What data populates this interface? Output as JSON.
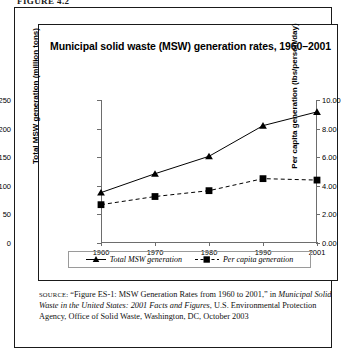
{
  "folio": {
    "text": "FIGURE 4.2"
  },
  "figure": {
    "title": "Municipal solid waste (MSW) generation rates, 1960–2001"
  },
  "legend": {
    "items": [
      {
        "label": "Total MSW generation",
        "marker": "triangle-marker",
        "line": "solid"
      },
      {
        "label": "Per capita generation",
        "marker": "square-marker",
        "line": "dashed"
      }
    ]
  },
  "source": {
    "label": "SOURCE:",
    "part1": " “Figure ES-1: MSW Generation Rates from 1960 to 2001,” in ",
    "italic": "Municipal Solid Waste in the United States: 2001 Facts and Figures",
    "part2": ", U.S. Environmental Protection Agency, Office of Solid Waste, Washington, DC, October 2003"
  },
  "chart_data": {
    "type": "line",
    "title": "Municipal solid waste (MSW) generation rates, 1960–2001",
    "xlabel": "",
    "categories": [
      "1960",
      "1970",
      "1980",
      "1990",
      "2001"
    ],
    "x_ticks": [
      "1960",
      "1970",
      "1980",
      "1990",
      "2001"
    ],
    "grid": false,
    "legend_position": "bottom",
    "axes": [
      {
        "side": "left",
        "label": "Total MSW generation (million tons)",
        "ylim": [
          0,
          250
        ],
        "ticks": [
          0,
          50,
          100,
          150,
          200,
          250
        ],
        "tick_labels": [
          "0",
          "50",
          "100",
          "150",
          "200",
          "250"
        ]
      },
      {
        "side": "right",
        "label": "Per capita generation (lbs/person/day)",
        "ylim": [
          0,
          10
        ],
        "ticks": [
          0,
          2,
          4,
          6,
          8,
          10
        ],
        "tick_labels": [
          "0.00",
          "2.00",
          "4.00",
          "6.00",
          "8.00",
          "10.00"
        ]
      }
    ],
    "series": [
      {
        "name": "Total MSW generation",
        "axis": "left",
        "marker": "triangle",
        "line": "solid",
        "color": "#000000",
        "values": [
          88.1,
          121.1,
          151.6,
          205.2,
          229.2
        ]
      },
      {
        "name": "Per capita generation",
        "axis": "right",
        "marker": "square",
        "line": "dashed",
        "color": "#000000",
        "values": [
          2.68,
          3.25,
          3.66,
          4.5,
          4.4
        ]
      }
    ]
  },
  "colors": {
    "frame": "#1a1a1a",
    "axis": "#6d6d6d",
    "ink": "#000000"
  }
}
